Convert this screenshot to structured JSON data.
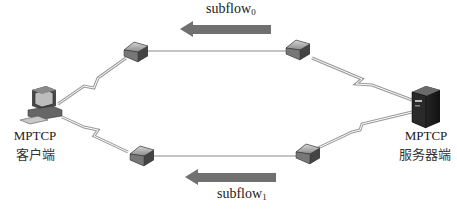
{
  "diagram": {
    "client": {
      "label_en": "MPTCP",
      "label_cn": "客户端",
      "icon": "desktop-computer-icon"
    },
    "server": {
      "label_en": "MPTCP",
      "label_cn": "服务器端",
      "icon": "tower-server-icon"
    },
    "routers": [
      {
        "id": "r-top-left",
        "icon": "router-icon"
      },
      {
        "id": "r-top-right",
        "icon": "router-icon"
      },
      {
        "id": "r-bottom-left",
        "icon": "router-icon"
      },
      {
        "id": "r-bottom-right",
        "icon": "router-icon"
      }
    ],
    "links": [
      {
        "from": "client",
        "to": "r-top-left",
        "type": "wireless-zigzag"
      },
      {
        "from": "r-top-left",
        "to": "r-top-right",
        "type": "wired"
      },
      {
        "from": "r-top-right",
        "to": "server",
        "type": "wireless-zigzag"
      },
      {
        "from": "client",
        "to": "r-bottom-left",
        "type": "wireless-zigzag"
      },
      {
        "from": "r-bottom-left",
        "to": "r-bottom-right",
        "type": "wired"
      },
      {
        "from": "r-bottom-right",
        "to": "server",
        "type": "wireless-zigzag"
      }
    ],
    "flows": [
      {
        "name": "subflow",
        "subscript": "0",
        "direction": "left",
        "color": "#6e6e6e"
      },
      {
        "name": "subflow",
        "subscript": "1",
        "direction": "left",
        "color": "#6e6e6e"
      }
    ]
  }
}
